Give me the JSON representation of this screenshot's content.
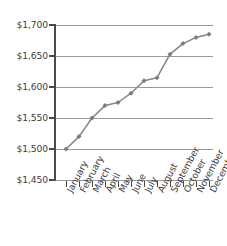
{
  "chart_data": {
    "type": "line",
    "title": "",
    "xlabel": "",
    "ylabel": "",
    "categories": [
      "January",
      "February",
      "March",
      "April",
      "May",
      "June",
      "July",
      "August",
      "September",
      "October",
      "November",
      "December"
    ],
    "values": [
      1500,
      1520,
      1550,
      1570,
      1575,
      1590,
      1610,
      1615,
      1653,
      1670,
      1680,
      1685
    ],
    "series": [
      {
        "name": "",
        "values": [
          1500,
          1520,
          1550,
          1570,
          1575,
          1590,
          1610,
          1615,
          1653,
          1670,
          1680,
          1685
        ]
      }
    ],
    "ylim": [
      1450,
      1700
    ],
    "ytick_values": [
      1700,
      1650,
      1600,
      1550,
      1500,
      1450
    ],
    "ytick_labels": [
      "$1,700",
      "$1,650",
      "$1,600",
      "$1,550",
      "$1,500",
      "$1,450"
    ],
    "grid": true,
    "legend": "none",
    "line_color": "#858585",
    "marker_color": "#7d7d7d",
    "gridline_color": "#9a9a9a",
    "axis_color": "#4a4a4a",
    "text_color": "#3d3d3d"
  }
}
